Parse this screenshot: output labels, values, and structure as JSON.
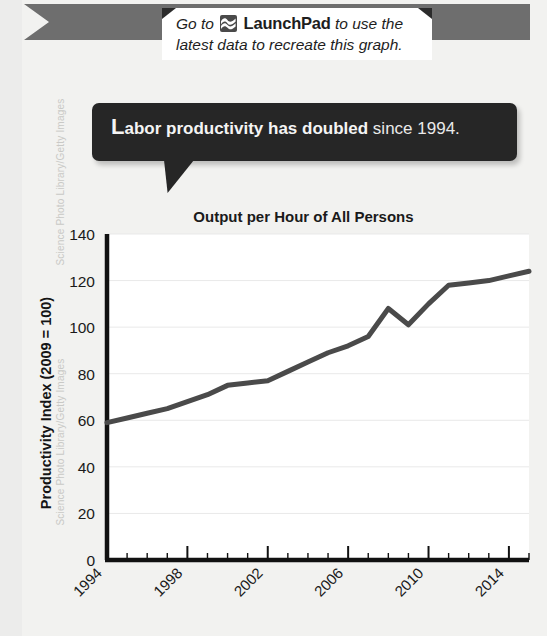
{
  "credit": {
    "line_a": "Science Photo Library/Getty Images",
    "line_b": "Science Photo Library/Getty Images"
  },
  "launchpad_note": {
    "line1_prefix": "Go to",
    "brand": "LaunchPad",
    "line1_suffix": "to use the",
    "line2": "latest data to recreate this graph.",
    "icon": "launchpad-wave-icon"
  },
  "callout": {
    "drop_cap": "L",
    "bold_text": "abor productivity has doubled",
    "plain_text": " since 1994."
  },
  "chart_data": {
    "type": "line",
    "title": "Output per Hour of All Persons",
    "xlabel": "",
    "ylabel": "Productivity Index (2009 = 100)",
    "ylim": [
      0,
      140
    ],
    "yticks": [
      0,
      20,
      40,
      60,
      80,
      100,
      120,
      140
    ],
    "xlim": [
      1994,
      2015
    ],
    "xticks": [
      1994,
      1998,
      2002,
      2006,
      2010,
      2014
    ],
    "xtick_labels": [
      "1994",
      "1998",
      "2002",
      "2006",
      "2010",
      "2014"
    ],
    "minor_xticks_every": 1,
    "grid": "horizontal",
    "legend": "none",
    "line_color": "#4a4a4a",
    "line_width": 5,
    "x": [
      1994,
      1995,
      1996,
      1997,
      1998,
      1999,
      2000,
      2001,
      2002,
      2003,
      2004,
      2005,
      2006,
      2007,
      2008,
      2009,
      2010,
      2011,
      2012,
      2013,
      2014,
      2015
    ],
    "values": [
      59,
      61,
      63,
      65,
      68,
      71,
      75,
      76,
      77,
      81,
      85,
      89,
      92,
      96,
      108,
      101,
      110,
      118,
      119,
      120,
      122,
      124
    ]
  }
}
